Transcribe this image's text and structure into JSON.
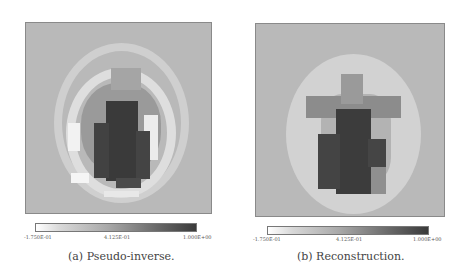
{
  "figure": {
    "panels": [
      {
        "id": "a",
        "caption": "(a)  Pseudo-inverse.",
        "colorbar": {
          "min_label": "-1.750E-01",
          "mid_label": "4.125E-01",
          "max_label": "1.000E+00"
        }
      },
      {
        "id": "b",
        "caption": "(b)  Reconstruction.",
        "colorbar": {
          "min_label": "-1.750E-01",
          "mid_label": "4.125E-01",
          "max_label": "1.000E+00"
        }
      }
    ],
    "colormap": {
      "low": "#ffffff",
      "high": "#2e2e2e",
      "background": "#b9b9b9"
    }
  }
}
